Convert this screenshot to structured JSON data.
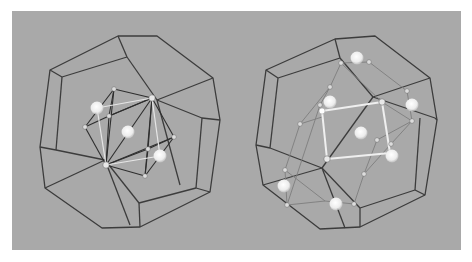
{
  "figure": {
    "background": "#a9a9a9",
    "panel": {
      "x": 12,
      "y": 11,
      "w": 449,
      "h": 239
    },
    "edge_color": "#3c3c3c",
    "atom_large_color": "#f2f2f2",
    "atom_small_color": "#d9d9d9"
  },
  "left_structure": {
    "label": "icosahedral cluster in dodecahedral cage",
    "outer_polygon": [
      [
        118,
        36
      ],
      [
        157,
        36
      ],
      [
        213,
        78
      ],
      [
        220,
        120
      ],
      [
        210,
        192
      ],
      [
        140,
        227
      ],
      [
        102,
        228
      ],
      [
        45,
        188
      ],
      [
        40,
        147
      ],
      [
        50,
        70
      ]
    ],
    "inner_lines": [
      [
        [
          50,
          70
        ],
        [
          62,
          77
        ]
      ],
      [
        [
          62,
          77
        ],
        [
          127,
          57
        ]
      ],
      [
        [
          118,
          36
        ],
        [
          127,
          57
        ]
      ],
      [
        [
          127,
          57
        ],
        [
          157,
          100
        ]
      ],
      [
        [
          157,
          100
        ],
        [
          213,
          78
        ]
      ],
      [
        [
          157,
          100
        ],
        [
          202,
          118
        ]
      ],
      [
        [
          202,
          118
        ],
        [
          220,
          120
        ]
      ],
      [
        [
          202,
          118
        ],
        [
          196,
          188
        ]
      ],
      [
        [
          196,
          188
        ],
        [
          210,
          192
        ]
      ],
      [
        [
          196,
          188
        ],
        [
          139,
          203
        ]
      ],
      [
        [
          139,
          203
        ],
        [
          140,
          227
        ]
      ],
      [
        [
          139,
          203
        ],
        [
          105,
          160
        ]
      ],
      [
        [
          105,
          160
        ],
        [
          45,
          188
        ]
      ],
      [
        [
          105,
          160
        ],
        [
          56,
          150
        ]
      ],
      [
        [
          56,
          150
        ],
        [
          40,
          147
        ]
      ],
      [
        [
          56,
          150
        ],
        [
          62,
          77
        ]
      ],
      [
        [
          157,
          100
        ],
        [
          180,
          185
        ]
      ],
      [
        [
          105,
          160
        ],
        [
          130,
          225
        ]
      ]
    ],
    "cluster_nodes": [
      [
        114,
        89
      ],
      [
        152,
        98
      ],
      [
        109,
        116
      ],
      [
        85,
        127
      ],
      [
        174,
        137
      ],
      [
        148,
        149
      ],
      [
        106,
        165
      ],
      [
        145,
        176
      ]
    ],
    "cluster_dark_bonds": [
      [
        [
          114,
          89
        ],
        [
          152,
          98
        ]
      ],
      [
        [
          114,
          89
        ],
        [
          109,
          116
        ]
      ],
      [
        [
          114,
          89
        ],
        [
          85,
          127
        ]
      ],
      [
        [
          114,
          89
        ],
        [
          106,
          165
        ]
      ],
      [
        [
          152,
          98
        ],
        [
          109,
          116
        ]
      ],
      [
        [
          152,
          98
        ],
        [
          174,
          137
        ]
      ],
      [
        [
          152,
          98
        ],
        [
          148,
          149
        ]
      ],
      [
        [
          152,
          98
        ],
        [
          145,
          176
        ]
      ],
      [
        [
          152,
          98
        ],
        [
          106,
          165
        ]
      ],
      [
        [
          109,
          116
        ],
        [
          85,
          127
        ]
      ],
      [
        [
          109,
          116
        ],
        [
          106,
          165
        ]
      ],
      [
        [
          109,
          116
        ],
        [
          152,
          98
        ]
      ],
      [
        [
          85,
          127
        ],
        [
          106,
          165
        ]
      ],
      [
        [
          174,
          137
        ],
        [
          148,
          149
        ]
      ],
      [
        [
          174,
          137
        ],
        [
          145,
          176
        ]
      ],
      [
        [
          148,
          149
        ],
        [
          106,
          165
        ]
      ],
      [
        [
          148,
          149
        ],
        [
          145,
          176
        ]
      ],
      [
        [
          106,
          165
        ],
        [
          145,
          176
        ]
      ],
      [
        [
          106,
          165
        ],
        [
          174,
          137
        ]
      ]
    ],
    "cluster_light_bonds": [
      [
        [
          97,
          108
        ],
        [
          152,
          98
        ]
      ],
      [
        [
          97,
          108
        ],
        [
          106,
          165
        ]
      ],
      [
        [
          160,
          156
        ],
        [
          106,
          165
        ]
      ],
      [
        [
          160,
          156
        ],
        [
          152,
          98
        ]
      ]
    ],
    "large_atoms": [
      [
        97,
        108
      ],
      [
        128,
        132
      ],
      [
        160,
        156
      ]
    ],
    "small_atoms": [
      [
        114,
        89
      ],
      [
        109,
        116
      ],
      [
        85,
        127
      ],
      [
        174,
        137
      ],
      [
        148,
        149
      ],
      [
        145,
        176
      ]
    ],
    "hub_atoms": [
      [
        152,
        98
      ],
      [
        106,
        165
      ]
    ]
  },
  "right_structure": {
    "label": "extended cluster in dodecahedral cage",
    "outer_polygon": [
      [
        335,
        39
      ],
      [
        375,
        36
      ],
      [
        430,
        78
      ],
      [
        437,
        120
      ],
      [
        425,
        195
      ],
      [
        360,
        227
      ],
      [
        320,
        229
      ],
      [
        263,
        185
      ],
      [
        256,
        145
      ],
      [
        266,
        70
      ]
    ],
    "inner_lines": [
      [
        [
          266,
          70
        ],
        [
          278,
          78
        ]
      ],
      [
        [
          278,
          78
        ],
        [
          340,
          58
        ]
      ],
      [
        [
          335,
          39
        ],
        [
          340,
          58
        ]
      ],
      [
        [
          340,
          58
        ],
        [
          373,
          97
        ]
      ],
      [
        [
          373,
          97
        ],
        [
          430,
          78
        ]
      ],
      [
        [
          373,
          97
        ],
        [
          435,
          118
        ]
      ],
      [
        [
          435,
          118
        ],
        [
          437,
          120
        ]
      ],
      [
        [
          420,
          118
        ],
        [
          415,
          190
        ]
      ],
      [
        [
          415,
          190
        ],
        [
          425,
          195
        ]
      ],
      [
        [
          415,
          190
        ],
        [
          360,
          208
        ]
      ],
      [
        [
          360,
          208
        ],
        [
          360,
          227
        ]
      ],
      [
        [
          360,
          208
        ],
        [
          322,
          168
        ]
      ],
      [
        [
          322,
          168
        ],
        [
          263,
          185
        ]
      ],
      [
        [
          322,
          168
        ],
        [
          270,
          148
        ]
      ],
      [
        [
          270,
          148
        ],
        [
          256,
          145
        ]
      ],
      [
        [
          270,
          148
        ],
        [
          278,
          78
        ]
      ],
      [
        [
          373,
          97
        ],
        [
          322,
          168
        ]
      ],
      [
        [
          322,
          168
        ],
        [
          345,
          228
        ]
      ]
    ],
    "grey_bonds": [
      [
        [
          341,
          63
        ],
        [
          369,
          62
        ]
      ],
      [
        [
          341,
          63
        ],
        [
          330,
          87
        ]
      ],
      [
        [
          369,
          62
        ],
        [
          407,
          91
        ]
      ],
      [
        [
          330,
          87
        ],
        [
          300,
          124
        ]
      ],
      [
        [
          300,
          124
        ],
        [
          285,
          170
        ]
      ],
      [
        [
          285,
          170
        ],
        [
          287,
          205
        ]
      ],
      [
        [
          287,
          205
        ],
        [
          325,
          201
        ]
      ],
      [
        [
          325,
          201
        ],
        [
          354,
          204
        ]
      ],
      [
        [
          354,
          204
        ],
        [
          364,
          174
        ]
      ],
      [
        [
          364,
          174
        ],
        [
          391,
          144
        ]
      ],
      [
        [
          391,
          144
        ],
        [
          412,
          121
        ]
      ],
      [
        [
          412,
          121
        ],
        [
          407,
          91
        ]
      ],
      [
        [
          341,
          63
        ],
        [
          382,
          102
        ]
      ],
      [
        [
          330,
          87
        ],
        [
          320,
          105
        ]
      ],
      [
        [
          320,
          105
        ],
        [
          287,
          205
        ]
      ],
      [
        [
          382,
          102
        ],
        [
          412,
          121
        ]
      ],
      [
        [
          364,
          174
        ],
        [
          377,
          140
        ]
      ],
      [
        [
          377,
          140
        ],
        [
          412,
          121
        ]
      ],
      [
        [
          285,
          170
        ],
        [
          325,
          201
        ]
      ],
      [
        [
          300,
          124
        ],
        [
          322,
          117
        ]
      ]
    ],
    "white_bonds": [
      [
        [
          322,
          111
        ],
        [
          382,
          102
        ]
      ],
      [
        [
          382,
          102
        ],
        [
          390,
          153
        ]
      ],
      [
        [
          322,
          111
        ],
        [
          327,
          159
        ]
      ],
      [
        [
          327,
          159
        ],
        [
          390,
          153
        ]
      ]
    ],
    "large_atoms": [
      [
        357,
        58
      ],
      [
        330,
        102
      ],
      [
        412,
        105
      ],
      [
        361,
        133
      ],
      [
        392,
        156
      ],
      [
        284,
        186
      ],
      [
        336,
        204
      ]
    ],
    "small_atoms": [
      [
        341,
        63
      ],
      [
        369,
        62
      ],
      [
        407,
        91
      ],
      [
        412,
        121
      ],
      [
        300,
        124
      ],
      [
        285,
        170
      ],
      [
        287,
        205
      ],
      [
        354,
        204
      ],
      [
        364,
        174
      ],
      [
        391,
        144
      ],
      [
        330,
        87
      ],
      [
        320,
        105
      ],
      [
        377,
        140
      ]
    ],
    "hub_atoms": [
      [
        382,
        102
      ],
      [
        327,
        159
      ]
    ],
    "bright_atoms": [
      [
        322,
        111
      ],
      [
        390,
        153
      ]
    ]
  }
}
